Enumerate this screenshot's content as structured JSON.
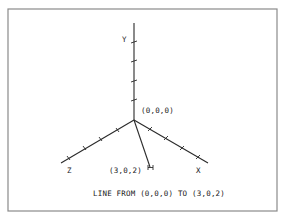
{
  "diagram": {
    "caption": "LINE FROM (0,0,0) TO (3,0,2)",
    "origin_label": "(0,0,0)",
    "endpoint_label": "(3,0,2)",
    "axes": [
      {
        "name": "X",
        "label": "X",
        "ticks": 4
      },
      {
        "name": "Y",
        "label": "Y",
        "ticks": 4
      },
      {
        "name": "Z",
        "label": "Z",
        "ticks": 4
      }
    ],
    "line": {
      "from": [
        0,
        0,
        0
      ],
      "to": [
        3,
        0,
        2
      ]
    },
    "colors": {
      "ink": "#2a2a2a",
      "frame": "#8a8a8a",
      "background": "#ffffff"
    }
  }
}
